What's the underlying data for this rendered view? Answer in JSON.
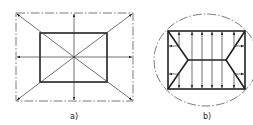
{
  "figure": {
    "panels": [
      {
        "id": "a",
        "label": "a)",
        "description": "Rectangular inner slab inside dash-dot outer boundary; arrows radiate from center along diagonals and axes"
      },
      {
        "id": "b",
        "label": "b)",
        "description": "Rectangle with hip-roof ridge lines inside a dash-dot ellipse; vertical double-headed arrows and short side arrows"
      }
    ]
  }
}
